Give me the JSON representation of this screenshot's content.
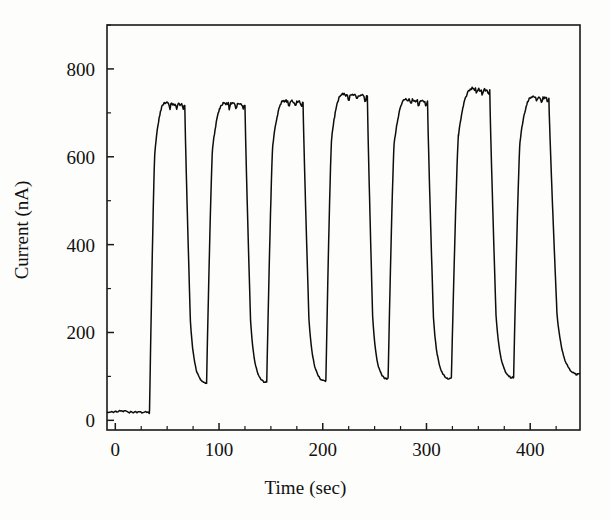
{
  "chart_data": {
    "type": "line",
    "title": "",
    "xlabel": "Time (sec)",
    "ylabel": "Current (nA)",
    "xlim": [
      -8,
      448
    ],
    "ylim": [
      -22,
      900
    ],
    "xticks": [
      0,
      100,
      200,
      300,
      400
    ],
    "xticklabels": [
      "0",
      "100",
      "200",
      "300",
      "400"
    ],
    "yticks": [
      0,
      200,
      400,
      600,
      800
    ],
    "yticklabels": [
      "0",
      "200",
      "400",
      "600",
      "800"
    ],
    "x_minor_interval": 25,
    "y_minor_interval": 100,
    "grid": false,
    "legend": null,
    "frame": "box",
    "line_color": "#0d0d0d",
    "background_color": "#fdfdfb",
    "series": [
      {
        "name": "amperometric current",
        "description": "Seven repeating injection cycles: rapid rise to a noisy plateau followed by exponential decay toward baseline.",
        "baseline_nA": 20,
        "cycles": [
          {
            "index": 1,
            "rise_start_sec": 33,
            "plateau_start_sec": 48,
            "plateau_end_sec": 67,
            "plateau_nA": 722,
            "decay_min_sec": 85,
            "decay_min_nA": 86
          },
          {
            "index": 2,
            "rise_start_sec": 88,
            "plateau_start_sec": 105,
            "plateau_end_sec": 125,
            "plateau_nA": 722,
            "decay_min_sec": 143,
            "decay_min_nA": 88
          },
          {
            "index": 3,
            "rise_start_sec": 146,
            "plateau_start_sec": 163,
            "plateau_end_sec": 181,
            "plateau_nA": 728,
            "decay_min_sec": 200,
            "decay_min_nA": 90
          },
          {
            "index": 4,
            "rise_start_sec": 203,
            "plateau_start_sec": 219,
            "plateau_end_sec": 243,
            "plateau_nA": 742,
            "decay_min_sec": 260,
            "decay_min_nA": 95
          },
          {
            "index": 5,
            "rise_start_sec": 263,
            "plateau_start_sec": 280,
            "plateau_end_sec": 301,
            "plateau_nA": 730,
            "decay_min_sec": 320,
            "decay_min_nA": 95
          },
          {
            "index": 6,
            "rise_start_sec": 324,
            "plateau_start_sec": 344,
            "plateau_end_sec": 361,
            "plateau_nA": 755,
            "decay_min_sec": 381,
            "decay_min_nA": 98
          },
          {
            "index": 7,
            "rise_start_sec": 384,
            "plateau_start_sec": 402,
            "plateau_end_sec": 418,
            "plateau_nA": 736,
            "decay_min_sec": 444,
            "decay_min_nA": 105
          }
        ]
      }
    ]
  }
}
